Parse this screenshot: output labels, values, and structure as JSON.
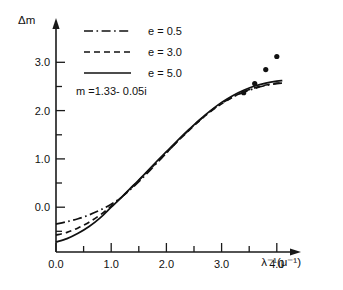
{
  "chart_data": {
    "type": "line",
    "title": "",
    "xlabel": "λ⁻¹(μ⁻¹)",
    "ylabel": "Δm",
    "xlim": [
      0.0,
      4.35
    ],
    "ylim": [
      -0.85,
      3.35
    ],
    "grid": false,
    "legend_position": "top-left-inside",
    "xticks": [
      0.0,
      1.0,
      2.0,
      3.0,
      4.0
    ],
    "xtick_labels": [
      "0.0",
      "1.0",
      "2.0",
      "3.0",
      "4.0"
    ],
    "xminor_ticks": [
      0.5,
      1.5,
      2.5,
      3.5
    ],
    "yticks": [
      0.0,
      1.0,
      2.0,
      3.0
    ],
    "ytick_labels": [
      "0.0",
      "1.0",
      "2.0",
      "3.0"
    ],
    "yminor_ticks": [
      0.5,
      1.5,
      2.5
    ],
    "annotations": [
      {
        "text": "m =1.33- 0.05i",
        "x": 0.18,
        "y": 2.62
      }
    ],
    "series": [
      {
        "name": "e = 0.5",
        "style": "dashdot",
        "x": [
          0.0,
          0.2,
          0.4,
          0.6,
          0.8,
          1.0,
          1.2,
          1.4,
          1.6,
          1.8,
          2.0,
          2.2,
          2.4,
          2.6,
          2.8,
          3.0,
          3.2,
          3.4,
          3.6,
          3.8,
          4.0,
          4.1
        ],
        "values": [
          -0.35,
          -0.3,
          -0.24,
          -0.16,
          -0.06,
          0.06,
          0.22,
          0.42,
          0.64,
          0.88,
          1.12,
          1.36,
          1.59,
          1.8,
          1.99,
          2.15,
          2.28,
          2.38,
          2.46,
          2.52,
          2.56,
          2.57
        ]
      },
      {
        "name": "e = 3.0",
        "style": "dashed",
        "x": [
          0.0,
          0.2,
          0.4,
          0.6,
          0.8,
          1.0,
          1.2,
          1.4,
          1.6,
          1.8,
          2.0,
          2.2,
          2.4,
          2.6,
          2.8,
          3.0,
          3.2,
          3.4,
          3.6,
          3.8,
          4.0,
          4.1
        ],
        "values": [
          -0.58,
          -0.52,
          -0.43,
          -0.31,
          -0.16,
          0.02,
          0.22,
          0.44,
          0.67,
          0.9,
          1.13,
          1.36,
          1.58,
          1.79,
          1.98,
          2.14,
          2.28,
          2.39,
          2.47,
          2.53,
          2.57,
          2.58
        ]
      },
      {
        "name": "e = 5.0",
        "style": "solid",
        "x": [
          0.0,
          0.2,
          0.4,
          0.6,
          0.8,
          1.0,
          1.2,
          1.4,
          1.6,
          1.8,
          2.0,
          2.2,
          2.4,
          2.6,
          2.8,
          3.0,
          3.2,
          3.4,
          3.6,
          3.8,
          4.0,
          4.1
        ],
        "values": [
          -0.72,
          -0.65,
          -0.54,
          -0.4,
          -0.22,
          0.0,
          0.22,
          0.45,
          0.68,
          0.92,
          1.15,
          1.38,
          1.6,
          1.81,
          2.0,
          2.17,
          2.31,
          2.42,
          2.51,
          2.57,
          2.61,
          2.62
        ]
      }
    ],
    "scatter": {
      "name": "measured points",
      "marker": "filled-circle",
      "x": [
        3.4,
        3.6,
        3.8,
        4.0
      ],
      "values": [
        2.37,
        2.56,
        2.85,
        3.12
      ]
    }
  },
  "legend": {
    "entries": [
      {
        "label": "e = 0.5",
        "style": "dashdot"
      },
      {
        "label": "e = 3.0",
        "style": "dashed"
      },
      {
        "label": "e = 5.0",
        "style": "solid"
      }
    ],
    "note": "m =1.33- 0.05i"
  },
  "axis": {
    "y_title": "Δm",
    "x_title": "λ⁻¹(μ⁻¹)"
  },
  "colors": {
    "ink": "#111111",
    "background": "#ffffff"
  }
}
